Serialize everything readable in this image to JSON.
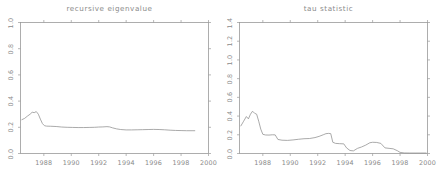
{
  "figure": {
    "background_color": "#ffffff",
    "line_color": "#8d8d8d",
    "axis_color": "#9a9a9a",
    "text_color": "#8a8a8a"
  },
  "chart_data": [
    {
      "type": "line",
      "panel": "left",
      "title": "recursive eigenvalue",
      "xlabel": "",
      "ylabel": "",
      "xlim": [
        1986.3,
        2000.0
      ],
      "ylim": [
        0.0,
        1.0
      ],
      "grid": false,
      "legend": "none",
      "xticks": [
        1988,
        1990,
        1992,
        1994,
        1996,
        1998,
        2000
      ],
      "xtick_labels": [
        "1988",
        "1990",
        "1992",
        "1994",
        "1996",
        "1998",
        "2000"
      ],
      "yticks": [
        0.0,
        0.2,
        0.4,
        0.6,
        0.8,
        1.0
      ],
      "ytick_labels": [
        "0.0",
        "0.2",
        "0.4",
        "0.6",
        "0.8",
        "1.0"
      ],
      "x": [
        1986.4,
        1986.6,
        1986.8,
        1987.0,
        1987.15,
        1987.3,
        1987.45,
        1987.6,
        1987.75,
        1987.9,
        1988.05,
        1988.2,
        1988.5,
        1988.9,
        1989.3,
        1989.7,
        1990.1,
        1990.5,
        1990.9,
        1991.3,
        1991.7,
        1992.0,
        1992.3,
        1992.6,
        1992.8,
        1993.0,
        1993.3,
        1993.6,
        1994.0,
        1994.4,
        1994.8,
        1995.2,
        1995.6,
        1996.0,
        1996.4,
        1996.8,
        1997.2,
        1997.6,
        1998.0,
        1998.4,
        1998.8,
        1999.0
      ],
      "y": [
        0.258,
        0.268,
        0.285,
        0.3,
        0.315,
        0.312,
        0.32,
        0.3,
        0.262,
        0.228,
        0.212,
        0.209,
        0.208,
        0.206,
        0.202,
        0.2,
        0.199,
        0.198,
        0.198,
        0.199,
        0.2,
        0.202,
        0.203,
        0.205,
        0.203,
        0.196,
        0.188,
        0.183,
        0.18,
        0.18,
        0.181,
        0.182,
        0.183,
        0.184,
        0.183,
        0.181,
        0.178,
        0.176,
        0.175,
        0.174,
        0.174,
        0.174
      ]
    },
    {
      "type": "line",
      "panel": "right",
      "title": "tau statistic",
      "xlabel": "",
      "ylabel": "",
      "xlim": [
        1986.3,
        2000.0
      ],
      "ylim": [
        0.0,
        1.4
      ],
      "grid": false,
      "legend": "none",
      "xticks": [
        1988,
        1990,
        1992,
        1994,
        1996,
        1998,
        2000
      ],
      "xtick_labels": [
        "1988",
        "1990",
        "1992",
        "1994",
        "1996",
        "1998",
        "2000"
      ],
      "yticks": [
        0.0,
        0.2,
        0.4,
        0.6,
        0.8,
        1.0,
        1.2,
        1.4
      ],
      "ytick_labels": [
        "0.0",
        "0.2",
        "0.4",
        "0.6",
        "0.8",
        "1.0",
        "1.2",
        "1.4"
      ],
      "x": [
        1986.4,
        1986.6,
        1986.8,
        1986.95,
        1987.1,
        1987.25,
        1987.4,
        1987.55,
        1987.7,
        1987.85,
        1988.0,
        1988.2,
        1988.45,
        1988.7,
        1988.9,
        1989.1,
        1989.4,
        1989.8,
        1990.2,
        1990.6,
        1991.0,
        1991.4,
        1991.8,
        1992.1,
        1992.4,
        1992.6,
        1992.8,
        1992.95,
        1993.1,
        1993.3,
        1993.6,
        1993.9,
        1994.1,
        1994.35,
        1994.6,
        1994.9,
        1995.2,
        1995.5,
        1995.8,
        1996.0,
        1996.3,
        1996.6,
        1996.9,
        1997.2,
        1997.5,
        1997.8,
        1998.0,
        1998.3,
        1998.7,
        1999.1,
        1999.5,
        1999.9
      ],
      "y": [
        0.295,
        0.345,
        0.395,
        0.37,
        0.42,
        0.452,
        0.43,
        0.42,
        0.345,
        0.26,
        0.205,
        0.198,
        0.197,
        0.2,
        0.199,
        0.15,
        0.142,
        0.14,
        0.145,
        0.152,
        0.158,
        0.16,
        0.17,
        0.183,
        0.2,
        0.212,
        0.215,
        0.212,
        0.12,
        0.108,
        0.105,
        0.103,
        0.06,
        0.032,
        0.028,
        0.055,
        0.07,
        0.09,
        0.115,
        0.12,
        0.118,
        0.108,
        0.06,
        0.055,
        0.05,
        0.03,
        0.012,
        0.006,
        0.005,
        0.005,
        0.005,
        0.005
      ]
    }
  ]
}
